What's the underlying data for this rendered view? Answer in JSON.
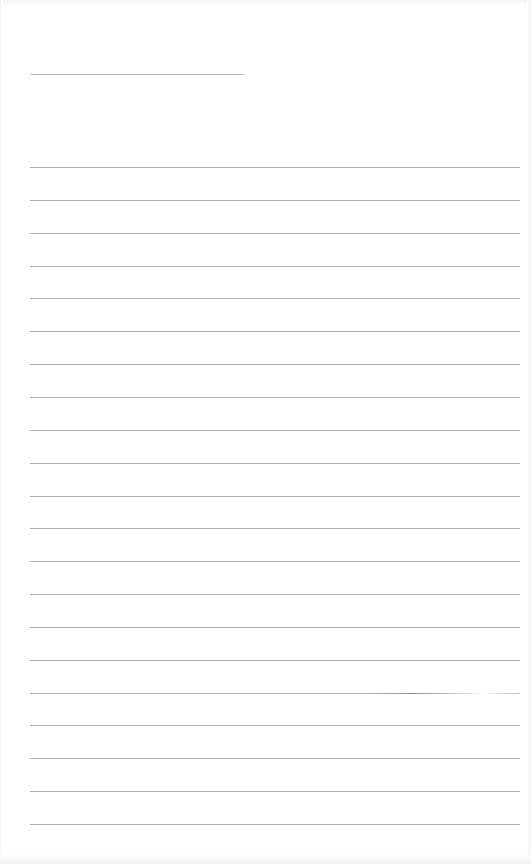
{
  "page": {
    "type": "lined-paper",
    "background": "#ffffff",
    "line_color": "#b0b0b0",
    "header_line": {
      "x": 31,
      "y": 74,
      "width": 213
    },
    "rules": {
      "count": 21,
      "x": 30,
      "width": 490,
      "first_y": 167,
      "spacing": 32.85
    }
  }
}
